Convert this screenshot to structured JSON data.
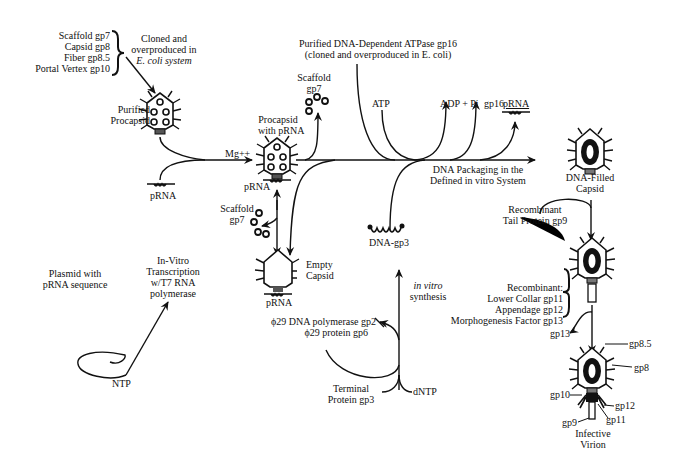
{
  "diagram": {
    "components": {
      "list": [
        "Scaffold gp7",
        "Capsid gp8",
        "Fiber gp8.5",
        "Portal Vertex gp10"
      ],
      "cloned_note": [
        "Cloned and",
        "overproduced in",
        "E. coli system"
      ]
    },
    "nodes": {
      "purified_procapsid": [
        "Purified",
        "Procapsid"
      ],
      "procapsid_with_prna": [
        "Procapsid",
        "with pRNA"
      ],
      "empty_capsid": [
        "Empty",
        "Capsid"
      ],
      "dna_filled_capsid": [
        "DNA-Filled",
        "Capsid"
      ],
      "infective_virion": [
        "Infective",
        "Virion"
      ],
      "plasmid": [
        "Plasmid with",
        "pRNA sequence"
      ],
      "dna_gp3": "DNA-gp3",
      "terminal_protein": [
        "Terminal",
        "Protein gp3"
      ]
    },
    "labels": {
      "mg": "Mg++",
      "prna_1": "pRNA",
      "prna_2": "pRNA",
      "prna_3": "pRNA",
      "prna_4": "pRNA",
      "scaffold_top": [
        "Scaffold",
        "gp7"
      ],
      "scaffold_bottom": [
        "Scaffold",
        "gp7"
      ],
      "atpase": [
        "Purified DNA-Dependent ATPase gp16",
        "(cloned and overproduced in E. coli)"
      ],
      "atp": "ATP",
      "adp": "ADP + Pi",
      "gp16": "gp16",
      "packaging": [
        "DNA Packaging in the",
        "Defined in vitro System"
      ],
      "transcription": [
        "In-Vitro",
        "Transcription",
        "w/T7 RNA",
        "polymerase"
      ],
      "ntp": "NTP",
      "dntp": "dNTP",
      "in_vitro_synthesis": [
        "in vitro",
        "synthesis"
      ],
      "polymerase": [
        "ϕ29 DNA polymerase gp2",
        "ϕ29 protein gp6"
      ],
      "tail_protein": [
        "Recombinant",
        "Tail Protein gp9"
      ],
      "recombinant_list": [
        "Recombinant:",
        "Lower Collar gp11",
        "Appendage gp12",
        "Morphogenesis Factor gp13"
      ],
      "gp13": "gp13",
      "virion_parts": {
        "gp8_5": "gp8.5",
        "gp8": "gp8",
        "gp10": "gp10",
        "gp12": "gp12",
        "gp11": "gp11",
        "gp9": "gp9"
      }
    }
  }
}
